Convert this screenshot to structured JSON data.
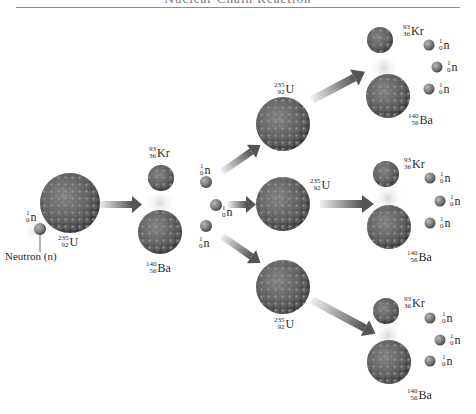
{
  "title": "Nuclear Chain Reaction",
  "colors": {
    "nucleus_dark": "#3d3d3d",
    "nucleus_light": "#9a9a9a",
    "neutron": "#8c8c8c",
    "arrow_start": "#e6e6e6",
    "arrow_end": "#4a4a4a",
    "rule": "#8a8a8a"
  },
  "neutron_caption": "Neutron (n)",
  "isotopes": {
    "uranium": {
      "mass": "235",
      "atomic": "92",
      "symbol": "U"
    },
    "krypton": {
      "mass": "93",
      "atomic": "36",
      "symbol": "Kr"
    },
    "barium": {
      "mass": "140",
      "atomic": "56",
      "symbol": "Ba"
    },
    "neutron": {
      "mass": "1",
      "atomic": "0",
      "symbol": "n"
    }
  },
  "stages": [
    {
      "name": "incoming",
      "items": [
        "neutron",
        "uranium-235"
      ]
    },
    {
      "name": "first-fission",
      "products": [
        "krypton-93",
        "barium-140",
        "3 neutrons"
      ]
    },
    {
      "name": "second-generation",
      "targets": [
        "uranium-235",
        "uranium-235",
        "uranium-235"
      ]
    },
    {
      "name": "second-fission",
      "groups": 3,
      "products_each": [
        "krypton-93",
        "barium-140",
        "3 neutrons"
      ]
    }
  ]
}
